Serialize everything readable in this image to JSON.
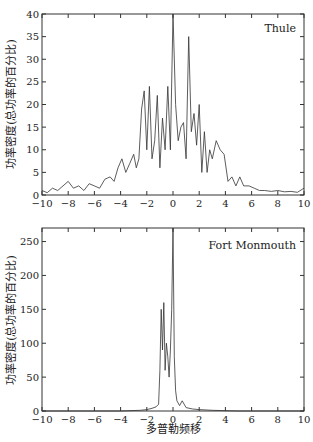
{
  "chart_data": [
    {
      "type": "line",
      "title": "",
      "annotation": "Thule",
      "xlabel": "",
      "ylabel": "功率密度(总功率的百分比)",
      "xlim": [
        -10,
        10
      ],
      "ylim": [
        0,
        40
      ],
      "xticks": [
        -10,
        -8,
        -6,
        -4,
        -2,
        0,
        2,
        4,
        6,
        8,
        10
      ],
      "yticks": [
        0,
        5,
        10,
        15,
        20,
        25,
        30,
        35,
        40
      ],
      "grid": false,
      "x": [
        -10,
        -9.6,
        -9.2,
        -8.8,
        -8.4,
        -8.0,
        -7.6,
        -7.2,
        -6.8,
        -6.4,
        -6.0,
        -5.6,
        -5.2,
        -4.8,
        -4.5,
        -4.2,
        -3.9,
        -3.6,
        -3.3,
        -3.0,
        -2.8,
        -2.6,
        -2.4,
        -2.2,
        -2.0,
        -1.8,
        -1.6,
        -1.4,
        -1.2,
        -1.0,
        -0.8,
        -0.6,
        -0.4,
        -0.2,
        0.0,
        0.2,
        0.4,
        0.6,
        0.8,
        1.0,
        1.2,
        1.4,
        1.6,
        1.8,
        2.0,
        2.2,
        2.4,
        2.6,
        2.8,
        3.0,
        3.3,
        3.6,
        3.9,
        4.2,
        4.5,
        4.8,
        5.1,
        5.4,
        5.8,
        6.2,
        6.6,
        7.0,
        7.5,
        8.0,
        8.5,
        9.0,
        9.5,
        10.0
      ],
      "values": [
        1,
        0.5,
        1.5,
        1,
        2,
        3,
        1.5,
        2,
        1,
        2.5,
        2,
        1.5,
        3.5,
        4,
        3,
        6,
        8,
        5,
        7,
        9,
        6,
        8,
        19,
        23,
        10,
        24,
        8,
        12,
        22,
        6,
        17,
        10,
        24,
        10,
        40,
        20,
        12,
        15,
        16,
        8,
        35,
        14,
        18,
        11,
        20,
        5,
        14,
        5,
        10,
        8,
        12,
        10,
        9,
        3,
        4,
        2,
        4,
        2,
        2,
        1.5,
        1,
        1,
        0.8,
        1,
        0.7,
        0.8,
        0.6,
        1.5
      ]
    },
    {
      "type": "line",
      "title": "",
      "annotation": "Fort Monmouth",
      "xlabel": "多普勒频移",
      "ylabel": "功率密度(总功率的百分比)",
      "xlim": [
        -10,
        10
      ],
      "ylim": [
        0,
        270
      ],
      "xticks": [
        -10,
        -8,
        -6,
        -4,
        -2,
        0,
        2,
        4,
        6,
        8,
        10
      ],
      "yticks": [
        0,
        50,
        100,
        150,
        200,
        250
      ],
      "grid": false,
      "x": [
        -10,
        -6,
        -4,
        -2.5,
        -2.0,
        -1.6,
        -1.3,
        -1.1,
        -1.0,
        -0.9,
        -0.8,
        -0.7,
        -0.6,
        -0.5,
        -0.4,
        -0.3,
        -0.2,
        -0.1,
        0.0,
        0.1,
        0.2,
        0.3,
        0.5,
        0.7,
        1.0,
        1.5,
        2.0,
        3.0,
        5.0,
        10.0
      ],
      "values": [
        0,
        0,
        0,
        1,
        2,
        4,
        6,
        10,
        60,
        150,
        90,
        160,
        60,
        100,
        80,
        50,
        90,
        150,
        270,
        80,
        30,
        15,
        8,
        15,
        5,
        3,
        2,
        1,
        0,
        0
      ]
    }
  ]
}
